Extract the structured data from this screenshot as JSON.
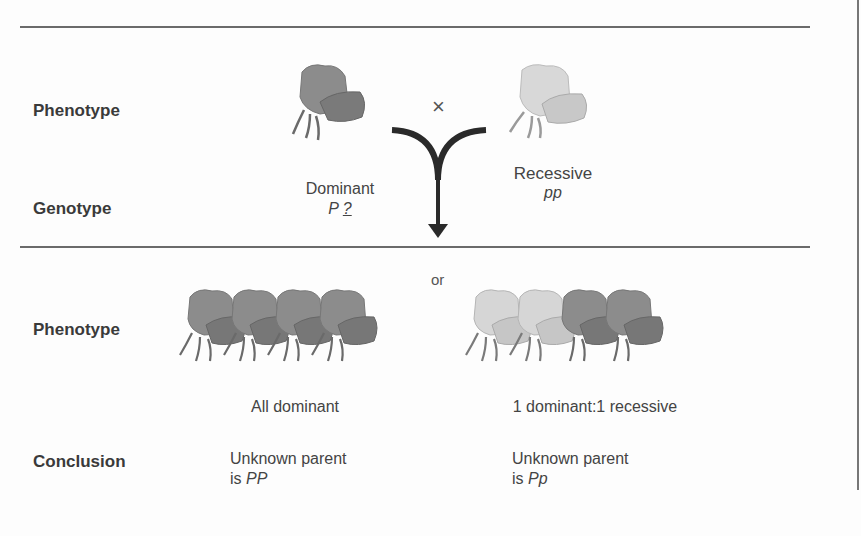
{
  "header_partial_glyphs": "top edge clipped title",
  "rows": {
    "parent_phenotype_label": "Phenotype",
    "parent_genotype_label": "Genotype",
    "offspring_phenotype_label": "Phenotype",
    "conclusion_label": "Conclusion"
  },
  "cross": {
    "symbol": "×",
    "left_parent": {
      "phenotype": "Dominant",
      "genotype_allele": "P",
      "genotype_unknown": "?",
      "flower_color": "#8a8a8a"
    },
    "right_parent": {
      "phenotype": "Recessive",
      "genotype": "pp",
      "flower_color": "#d4d4d4"
    }
  },
  "outcomes": {
    "or_label": "or",
    "left": {
      "phenotype": "All dominant",
      "conclusion_line1": "Unknown parent",
      "conclusion_prefix": "is ",
      "conclusion_genotype": "PP",
      "flowers": [
        "dominant",
        "dominant",
        "dominant",
        "dominant"
      ]
    },
    "right": {
      "phenotype": "1 dominant:1 recessive",
      "conclusion_line1": "Unknown parent",
      "conclusion_prefix": "is ",
      "conclusion_genotype": "Pp",
      "flowers": [
        "recessive",
        "recessive",
        "dominant",
        "dominant"
      ]
    }
  },
  "colors": {
    "dominant": "#8c8c8c",
    "dominant_dark": "#6e6e6e",
    "recessive": "#d6d6d6",
    "recessive_dark": "#b5b5b5",
    "rule": "#6b6b6b",
    "arrow": "#2a2a2a"
  }
}
